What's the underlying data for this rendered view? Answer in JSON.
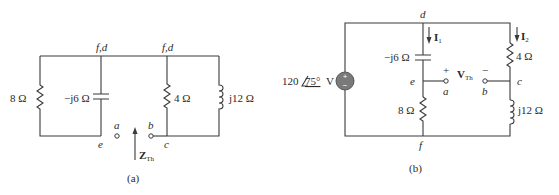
{
  "circuit_a": {
    "caption": "(a)",
    "nodes": {
      "top_left": "f,d",
      "top_right": "f,d",
      "bottom_left": "e",
      "bottom_right": "c",
      "terminal_a": "a",
      "terminal_b": "b"
    },
    "components": [
      {
        "type": "resistor",
        "label": "8 Ω"
      },
      {
        "type": "capacitor",
        "label": "−j6 Ω"
      },
      {
        "type": "resistor",
        "label": "4 Ω"
      },
      {
        "type": "inductor",
        "label": "j12 Ω"
      }
    ],
    "impedance_label": "Z",
    "impedance_sub": "Th"
  },
  "circuit_b": {
    "caption": "(b)",
    "source": {
      "magnitude": "120",
      "angle": "75°",
      "unit": "V",
      "plus": "+",
      "minus": "−"
    },
    "nodes": {
      "top": "d",
      "bottom": "f",
      "mid_left": "e",
      "mid_right": "c",
      "terminal_a": "a",
      "terminal_b": "b"
    },
    "currents": [
      {
        "label": "I",
        "sub": "1"
      },
      {
        "label": "I",
        "sub": "2"
      }
    ],
    "components": [
      {
        "type": "capacitor",
        "label": "−j6 Ω"
      },
      {
        "type": "resistor",
        "label": "8 Ω"
      },
      {
        "type": "resistor",
        "label": "4 Ω"
      },
      {
        "type": "inductor",
        "label": "j12 Ω"
      }
    ],
    "voltage": {
      "label": "V",
      "sub": "Th",
      "plus": "+",
      "minus": "−"
    }
  }
}
